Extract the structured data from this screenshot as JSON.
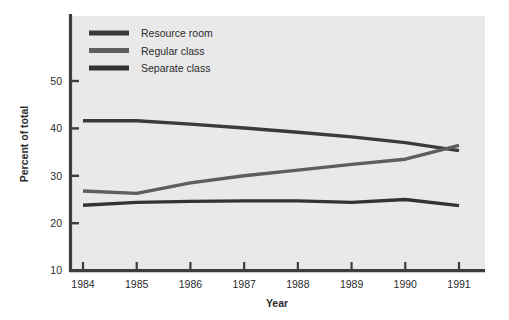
{
  "chart_data": {
    "type": "line",
    "title": "",
    "subtitle": "",
    "xlabel": "Year",
    "ylabel": "Percent of total",
    "categories": [
      "1984",
      "1985",
      "1986",
      "1987",
      "1988",
      "1989",
      "1990",
      "1991"
    ],
    "x": [
      1984,
      1985,
      1986,
      1987,
      1988,
      1989,
      1990,
      1991
    ],
    "xlim": [
      1984,
      1991
    ],
    "ylim": [
      10,
      50
    ],
    "yticks": [
      10,
      20,
      30,
      40,
      50
    ],
    "ytick_labels": [
      "10",
      "20",
      "30",
      "40",
      "50"
    ],
    "xtick_labels": [
      "1984",
      "1985",
      "1986",
      "1987",
      "1988",
      "1989",
      "1990",
      "1991"
    ],
    "grid": false,
    "legend_position": "top-left",
    "background": "#e9e9e9",
    "series": [
      {
        "name": "Resource room",
        "color": "#3a3a3a",
        "values": [
          41.6,
          41.6,
          40.9,
          40.1,
          39.2,
          38.2,
          37.0,
          35.3
        ]
      },
      {
        "name": "Regular class",
        "color": "#5e5e5e",
        "values": [
          26.8,
          26.3,
          28.5,
          30.0,
          31.2,
          32.4,
          33.5,
          36.4
        ]
      },
      {
        "name": "Separate class",
        "color": "#333333",
        "values": [
          23.8,
          24.4,
          24.6,
          24.7,
          24.7,
          24.4,
          25.0,
          23.7
        ]
      }
    ],
    "annotations": []
  },
  "legend": {
    "items": [
      {
        "label": "Resource room",
        "swatch_color": "#3a3a3a"
      },
      {
        "label": "Regular class",
        "swatch_color": "#5e5e5e"
      },
      {
        "label": "Separate class",
        "swatch_color": "#333333"
      }
    ]
  },
  "axes": {
    "y_title": "Percent of total",
    "x_title": "Year",
    "y_ticks": [
      "50",
      "40",
      "30",
      "20",
      "10"
    ],
    "x_ticks": [
      "1984",
      "1985",
      "1986",
      "1987",
      "1988",
      "1989",
      "1990",
      "1991"
    ]
  },
  "colors": {
    "panel": "#e9e9e9",
    "axis": "#3d3d3d",
    "text": "#2b2b2b",
    "page": "#ffffff"
  }
}
